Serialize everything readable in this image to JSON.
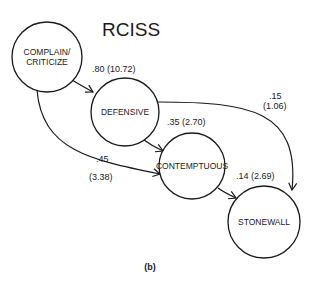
{
  "title": "RCISS",
  "caption": "(b)",
  "nodes": [
    {
      "id": "complain",
      "line1": "COMPLAIN/",
      "line2": "CRITICIZE"
    },
    {
      "id": "defensive",
      "label": "DEFENSIVE"
    },
    {
      "id": "contemptuous",
      "label": "CONTEMPTUOUS"
    },
    {
      "id": "stonewall",
      "label": "STONEWALL"
    }
  ],
  "edges": [
    {
      "from": "complain",
      "to": "defensive",
      "label": ".80 (10.72)"
    },
    {
      "from": "defensive",
      "to": "contemptuous",
      "label": ".35 (2.70)"
    },
    {
      "from": "complain",
      "to": "contemptuous",
      "label_top": ".45",
      "label_bottom": "(3.38)"
    },
    {
      "from": "defensive",
      "to": "stonewall",
      "label_top": ".15",
      "label_bottom": "(1.06)"
    },
    {
      "from": "contemptuous",
      "to": "stonewall",
      "label": ".14 (2.69)"
    }
  ]
}
